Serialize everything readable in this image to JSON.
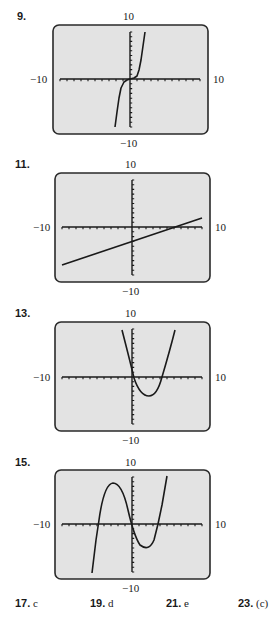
{
  "panels": [
    {
      "number": "9.",
      "ymax_label": "10",
      "ymin_label": "−10",
      "xmin_label": "−10",
      "xmax_label": "10",
      "frame": {
        "x": 53,
        "y": 25,
        "w": 155,
        "h": 109
      },
      "origin": {
        "x": 130,
        "y": 79
      },
      "axis": {
        "left": 60,
        "right": 200,
        "top": 32,
        "bottom": 127
      },
      "curve": "M115,127 L117,112 L119,98 L121,88 L124,82 L127,80 L130,79 L134,78 L137,76 L139,70 L141,60 L143,46 L145,32"
    },
    {
      "number": "11.",
      "ymax_label": "10",
      "ymin_label": "−10",
      "xmin_label": "−10",
      "xmax_label": "10",
      "frame": {
        "x": 55,
        "y": 173,
        "w": 155,
        "h": 109
      },
      "origin": {
        "x": 132,
        "y": 227
      },
      "axis": {
        "left": 62,
        "right": 202,
        "top": 180,
        "bottom": 275
      },
      "curve": "M62,265 L202,218"
    },
    {
      "number": "13.",
      "ymax_label": "10",
      "ymin_label": "−10",
      "xmin_label": "−10",
      "xmax_label": "10",
      "frame": {
        "x": 55,
        "y": 322,
        "w": 155,
        "h": 109
      },
      "origin": {
        "x": 132,
        "y": 377
      },
      "axis": {
        "left": 62,
        "right": 202,
        "top": 329,
        "bottom": 424
      },
      "curve": "M122,330 Q131,365 134,378 Q140,396 149,396 Q157,396 162,377 Q170,350 175,330"
    },
    {
      "number": "15.",
      "ymax_label": "10",
      "ymin_label": "−10",
      "xmin_label": "−10",
      "xmax_label": "10",
      "frame": {
        "x": 55,
        "y": 470,
        "w": 155,
        "h": 109
      },
      "origin": {
        "x": 132,
        "y": 524
      },
      "axis": {
        "left": 62,
        "right": 202,
        "top": 477,
        "bottom": 572
      },
      "curve": "M92,573 L96,540 L99,520 Q104,484 113,483 Q122,483 128,510 Q134,536 140,545 Q149,552 154,540 L158,524 L162,505 L167,476"
    }
  ],
  "answers": [
    {
      "number": "17.",
      "value": "c"
    },
    {
      "number": "19.",
      "value": "d"
    },
    {
      "number": "21.",
      "value": "e"
    },
    {
      "number": "23.",
      "value": "(c)"
    }
  ],
  "colors": {
    "screen": "#e3e3e3",
    "frame": "#2a2a2a",
    "ink": "#1a1a1a"
  }
}
